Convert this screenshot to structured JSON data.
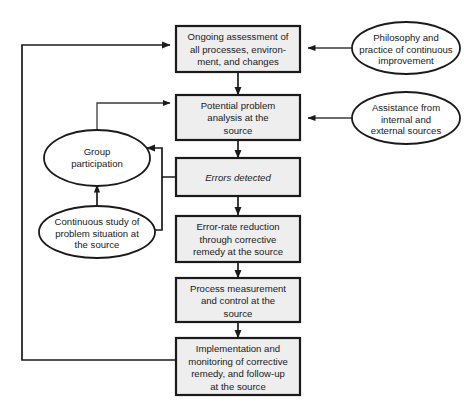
{
  "diagram": {
    "colors": {
      "box_fill": "#eeeeee",
      "box_border": "#1a1a1a",
      "ellipse_fill": "#ffffff",
      "ellipse_border": "#1a1a1a",
      "connector": "#1a1a1a",
      "background": "#ffffff"
    },
    "process_boxes": [
      {
        "id": "ongoing-assessment",
        "lines": [
          "Ongoing assessment of",
          "all processes, environ-",
          "ment, and changes"
        ],
        "italic": false
      },
      {
        "id": "potential-problem-analysis",
        "lines": [
          "Potential problem",
          "analysis at the",
          "source"
        ],
        "italic": false
      },
      {
        "id": "errors-detected",
        "lines": [
          "Errors detected"
        ],
        "italic": true
      },
      {
        "id": "error-rate-reduction",
        "lines": [
          "Error-rate reduction",
          "through corrective",
          "remedy at the source"
        ],
        "italic": false
      },
      {
        "id": "process-measurement",
        "lines": [
          "Process measurement",
          "and control at the",
          "source"
        ],
        "italic": false
      },
      {
        "id": "implementation-monitoring",
        "lines": [
          "Implementation and",
          "monitoring of corrective",
          "remedy, and follow-up",
          "at the source"
        ],
        "italic": false
      }
    ],
    "ellipses": [
      {
        "id": "philosophy-practice",
        "lines": [
          "Philosophy and",
          "practice of continuous",
          "improvement"
        ]
      },
      {
        "id": "assistance-sources",
        "lines": [
          "Assistance from",
          "internal and",
          "external sources"
        ]
      },
      {
        "id": "group-participation",
        "lines": [
          "Group",
          "participation"
        ]
      },
      {
        "id": "continuous-study",
        "lines": [
          "Continuous study of",
          "problem situation at",
          "the source"
        ]
      }
    ],
    "connectors": [
      {
        "id": "ongoing-to-potential",
        "from": "ongoing-assessment",
        "to": "potential-problem-analysis",
        "arrow": "single"
      },
      {
        "id": "potential-to-errors",
        "from": "potential-problem-analysis",
        "to": "errors-detected",
        "arrow": "single"
      },
      {
        "id": "errors-to-reduction",
        "from": "errors-detected",
        "to": "error-rate-reduction",
        "arrow": "single"
      },
      {
        "id": "reduction-to-measurement",
        "from": "error-rate-reduction",
        "to": "process-measurement",
        "arrow": "single"
      },
      {
        "id": "measurement-to-implementation",
        "from": "process-measurement",
        "to": "implementation-monitoring",
        "arrow": "single"
      },
      {
        "id": "implementation-feedback-to-ongoing",
        "from": "implementation-monitoring",
        "to": "ongoing-assessment",
        "arrow": "single"
      },
      {
        "id": "philosophy-to-ongoing",
        "from": "philosophy-practice",
        "to": "ongoing-assessment",
        "arrow": "single"
      },
      {
        "id": "assistance-to-potential",
        "from": "assistance-sources",
        "to": "potential-problem-analysis",
        "arrow": "single"
      },
      {
        "id": "errors-to-group",
        "from": "errors-detected",
        "to": "group-participation",
        "arrow": "single"
      },
      {
        "id": "errors-to-study",
        "from": "errors-detected",
        "to": "continuous-study",
        "arrow": "single"
      },
      {
        "id": "group-study-exchange",
        "from": "continuous-study",
        "to": "group-participation",
        "arrow": "double"
      },
      {
        "id": "group-to-potential",
        "from": "group-participation",
        "to": "potential-problem-analysis",
        "arrow": "single"
      }
    ]
  }
}
